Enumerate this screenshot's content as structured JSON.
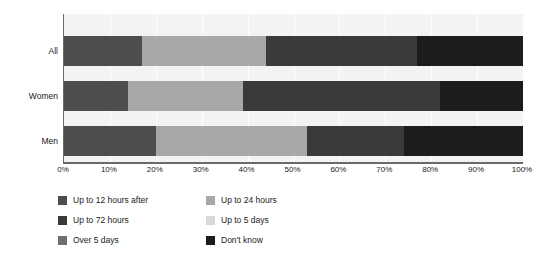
{
  "chart_data": {
    "type": "bar",
    "orientation": "horizontal",
    "stacked": true,
    "normalized_percent": true,
    "title": "",
    "subtitle": "",
    "xlabel": "",
    "ylabel": "",
    "xlim": [
      0,
      100
    ],
    "grid": true,
    "legend_position": "bottom",
    "categories": [
      "All",
      "Women",
      "Men"
    ],
    "tick_labels": [
      "0%",
      "10%",
      "20%",
      "30%",
      "40%",
      "50%",
      "60%",
      "70%",
      "80%",
      "90%",
      "100%"
    ],
    "tick_values": [
      0,
      10,
      20,
      30,
      40,
      50,
      60,
      70,
      80,
      90,
      100
    ],
    "series": [
      {
        "name": "Up to 12 hours after",
        "color": "#4d4d4d",
        "values": [
          17,
          14,
          20
        ]
      },
      {
        "name": "Up to 24 hours",
        "color": "#a8a8a8",
        "values": [
          27,
          25,
          33
        ]
      },
      {
        "name": "Up to 72 hours",
        "color": "#3a3a3a",
        "values": [
          0,
          0,
          0
        ]
      },
      {
        "name": "Up to 5 days",
        "color": "#d9d9d9",
        "values": [
          0,
          0,
          0
        ]
      },
      {
        "name": "Over 5 days",
        "color": "#3a3a3a",
        "values": [
          33,
          43,
          21
        ]
      },
      {
        "name": "Don't know",
        "color": "#1c1c1c",
        "values": [
          23,
          18,
          26
        ]
      }
    ],
    "segment_boundaries": {
      "All": [
        17,
        44,
        77,
        100
      ],
      "Women": [
        14,
        39,
        82,
        100
      ],
      "Men": [
        20,
        53,
        74,
        100
      ]
    }
  },
  "legend": {
    "columns": [
      {
        "items": [
          {
            "label": "Up to 12 hours after",
            "color": "#4d4d4d"
          },
          {
            "label": "Up to 72 hours",
            "color": "#3a3a3a"
          },
          {
            "label": "Over 5 days",
            "color": "#6e6e6e"
          }
        ]
      },
      {
        "items": [
          {
            "label": "Up to 24 hours",
            "color": "#a8a8a8"
          },
          {
            "label": "Up to 5 days",
            "color": "#d9d9d9"
          },
          {
            "label": "Don't know",
            "color": "#1c1c1c"
          }
        ]
      }
    ]
  },
  "colors": {
    "plot_background": "#f3f3f3",
    "page_background": "#ffffff",
    "axis": "#6a6a6a",
    "gridline": "#ffffff",
    "text": "#1a1a1a"
  }
}
